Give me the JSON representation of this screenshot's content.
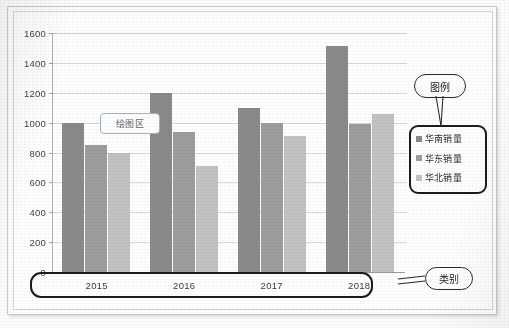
{
  "chart_data": {
    "type": "bar",
    "title": "",
    "subtitle": "",
    "xlabel": "",
    "ylabel": "",
    "categories": [
      "2015",
      "2016",
      "2017",
      "2018"
    ],
    "series": [
      {
        "name": "华南销量",
        "color": "#8a8a8a",
        "values": [
          1000,
          1200,
          1100,
          1510
        ]
      },
      {
        "name": "华东销量",
        "color": "#9d9d9d",
        "values": [
          850,
          940,
          1000,
          990
        ]
      },
      {
        "name": "华北销量",
        "color": "#c2c2c2",
        "values": [
          800,
          710,
          910,
          1060
        ]
      }
    ],
    "ylim": [
      0,
      1600
    ],
    "ytick_step": 200,
    "yticks": [
      "1600",
      "1400",
      "1200",
      "1000",
      "800",
      "600",
      "400",
      "200",
      "0"
    ],
    "grid": true,
    "legend_position": "right"
  },
  "annotations": {
    "plot_area_label": "绘图区",
    "legend_callout_label": "图例",
    "category_callout_label": "类别"
  },
  "legend": {
    "entries": [
      {
        "label": "华南销量"
      },
      {
        "label": "华东销量"
      },
      {
        "label": "华北销量"
      }
    ]
  }
}
